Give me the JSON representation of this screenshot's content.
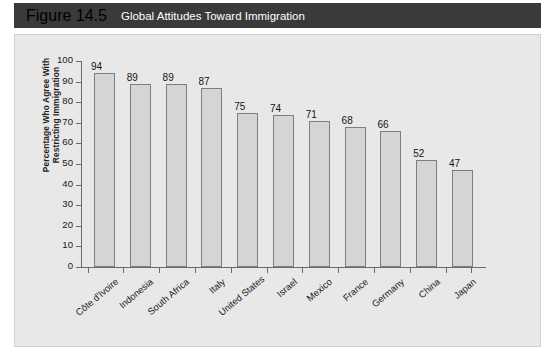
{
  "header": {
    "figure_number": "Figure 14.5",
    "title": "Global Attitudes Toward Immigration"
  },
  "colors": {
    "header_bg": "#3a3a3a",
    "header_text": "#ffffff",
    "panel_bg": "#e8e8e8",
    "bar_fill": "#d5d5d5",
    "bar_border": "#7e7e7e",
    "axis": "#6b6b6b",
    "text": "#1a1a1a"
  },
  "chart_data": {
    "type": "bar",
    "title": "Global Attitudes Toward Immigration",
    "xlabel": "",
    "ylabel_line1": "Percentage Who Agree With",
    "ylabel_line2": "Restricting Immigration",
    "ylim": [
      0,
      100
    ],
    "yticks": [
      0,
      10,
      20,
      30,
      40,
      50,
      60,
      70,
      80,
      90,
      100
    ],
    "ytick_labels": [
      "0",
      "10",
      "20",
      "30",
      "40",
      "50",
      "60",
      "70",
      "80",
      "90",
      "100"
    ],
    "grid": false,
    "legend": false,
    "categories": [
      "Côte d'Ivoire",
      "Indonesia",
      "South Africa",
      "Italy",
      "United States",
      "Israel",
      "Mexico",
      "France",
      "Germany",
      "China",
      "Japan"
    ],
    "values": [
      94,
      89,
      89,
      87,
      75,
      74,
      71,
      68,
      66,
      52,
      47
    ],
    "value_labels": [
      "94",
      "89",
      "89",
      "87",
      "75",
      "74",
      "71",
      "68",
      "66",
      "52",
      "47"
    ]
  }
}
